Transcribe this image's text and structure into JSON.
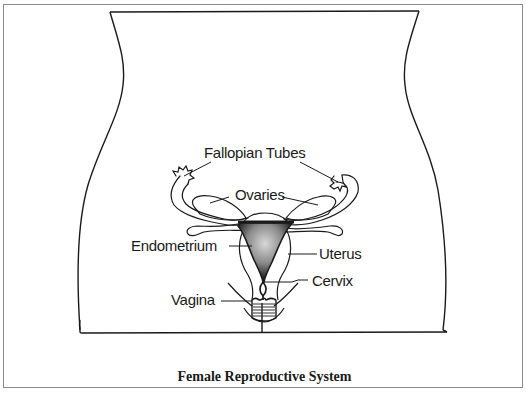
{
  "diagram": {
    "caption": "Female Reproductive System",
    "labels": {
      "fallopian_tubes": "Fallopian Tubes",
      "ovaries": "Ovaries",
      "endometrium": "Endometrium",
      "uterus": "Uterus",
      "cervix": "Cervix",
      "vagina": "Vagina"
    },
    "colors": {
      "line": "#1a1a1a",
      "frame": "#8a8a8a",
      "endometrium_fill": "#2a2a2a",
      "background": "#ffffff"
    }
  }
}
